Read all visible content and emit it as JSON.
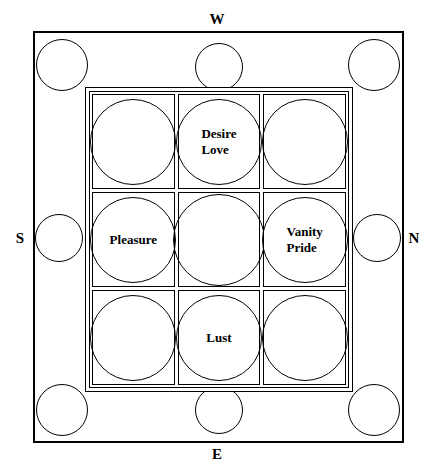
{
  "diagram": {
    "stroke_color": "#000000",
    "background_color": "#ffffff",
    "compass": {
      "top": "W",
      "bottom": "E",
      "left": "S",
      "right": "N"
    },
    "outer_frame": {
      "perimeter_circles": [
        {
          "position": "top-left",
          "label": ""
        },
        {
          "position": "top-center",
          "label": ""
        },
        {
          "position": "top-right",
          "label": ""
        },
        {
          "position": "middle-left",
          "label": ""
        },
        {
          "position": "middle-right",
          "label": ""
        },
        {
          "position": "bottom-left",
          "label": ""
        },
        {
          "position": "bottom-center",
          "label": ""
        },
        {
          "position": "bottom-right",
          "label": ""
        }
      ]
    },
    "grid": {
      "rows": 3,
      "columns": 3,
      "cells": [
        {
          "row": 1,
          "col": 1,
          "label": ""
        },
        {
          "row": 1,
          "col": 2,
          "label": "Desire\nLove"
        },
        {
          "row": 1,
          "col": 3,
          "label": ""
        },
        {
          "row": 2,
          "col": 1,
          "label": "Pleasure"
        },
        {
          "row": 2,
          "col": 2,
          "label": ""
        },
        {
          "row": 2,
          "col": 3,
          "label": "Vanity\nPride"
        },
        {
          "row": 3,
          "col": 1,
          "label": ""
        },
        {
          "row": 3,
          "col": 2,
          "label": "Lust"
        },
        {
          "row": 3,
          "col": 3,
          "label": ""
        }
      ]
    }
  }
}
